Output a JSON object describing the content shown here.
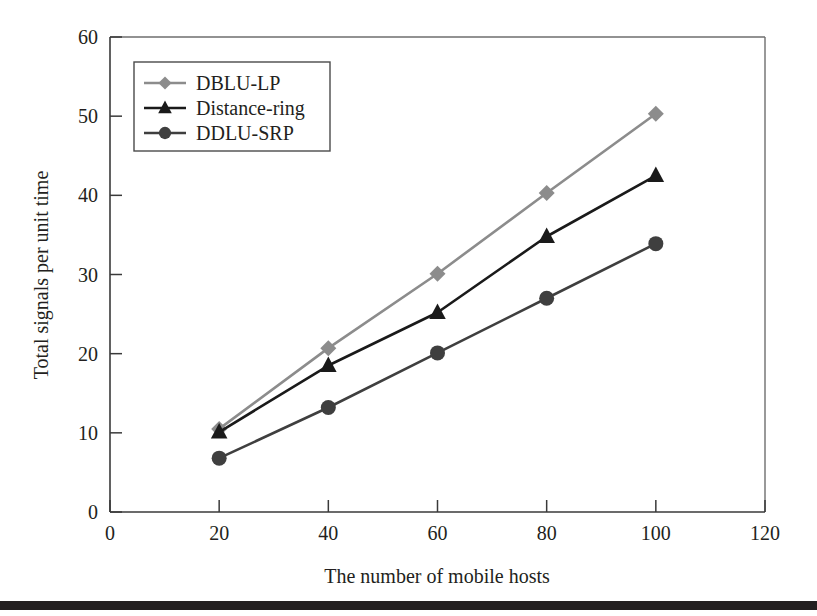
{
  "figure": {
    "background_color": "#ffffff",
    "bottom_rule_color": "#231f20"
  },
  "chart_data": {
    "type": "line",
    "title": "",
    "xlabel": "The number of mobile hosts",
    "ylabel": "Total signals per unit time",
    "x": [
      20,
      40,
      60,
      80,
      100
    ],
    "xlim": [
      0,
      120
    ],
    "ylim": [
      0,
      60
    ],
    "xticks": [
      0,
      20,
      40,
      60,
      80,
      100,
      120
    ],
    "yticks": [
      0,
      10,
      20,
      30,
      40,
      50,
      60
    ],
    "xtick_labels": [
      "0",
      "20",
      "40",
      "60",
      "80",
      "100",
      "120"
    ],
    "ytick_labels": [
      "0",
      "10",
      "20",
      "30",
      "40",
      "50",
      "60"
    ],
    "grid": false,
    "legend_position": "upper left",
    "series": [
      {
        "name": "DBLU-LP",
        "marker": "diamond",
        "color": "#8c8c8c",
        "values": [
          10.5,
          20.7,
          30.1,
          40.3,
          50.3
        ]
      },
      {
        "name": "Distance-ring",
        "marker": "triangle",
        "color": "#1a1a1a",
        "values": [
          10.1,
          18.5,
          25.2,
          34.8,
          42.5
        ]
      },
      {
        "name": "DDLU-SRP",
        "marker": "circle",
        "color": "#3f3f3f",
        "values": [
          6.8,
          13.2,
          20.1,
          27.0,
          33.9
        ]
      }
    ]
  }
}
